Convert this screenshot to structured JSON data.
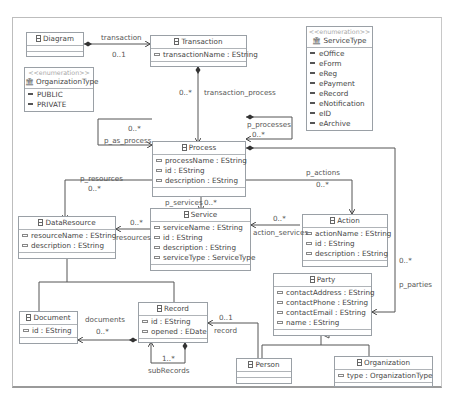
{
  "diagram": {
    "classes": {
      "diagram": {
        "name": "Diagram",
        "attributes": []
      },
      "transaction": {
        "name": "Transaction",
        "attributes": [
          "transactionName : EString"
        ]
      },
      "process": {
        "name": "Process",
        "attributes": [
          "processName : EString",
          "id : EString",
          "description : EString"
        ]
      },
      "data_resource": {
        "name": "DataResource",
        "attributes": [
          "resourceName : EString",
          "description : EString"
        ]
      },
      "service": {
        "name": "Service",
        "attributes": [
          "serviceName : EString",
          "id : EString",
          "description : EString",
          "serviceType : ServiceType"
        ]
      },
      "action": {
        "name": "Action",
        "attributes": [
          "actionName : EString",
          "id : EString",
          "description : EString"
        ]
      },
      "party": {
        "name": "Party",
        "attributes": [
          "contactAddress : EString",
          "contactPhone : EString",
          "contactEmail : EString",
          "name : EString"
        ]
      },
      "document": {
        "name": "Document",
        "attributes": [
          "id : EString"
        ]
      },
      "record": {
        "name": "Record",
        "attributes": [
          "id : EString",
          "opened : EDate"
        ]
      },
      "person": {
        "name": "Person",
        "attributes": []
      },
      "organization": {
        "name": "Organization",
        "attributes": [
          "type : OrganizationType"
        ]
      }
    },
    "enums": {
      "organization_type": {
        "stereotype": "<<enumeration>>",
        "name": "OrganizationType",
        "literals": [
          "PUBLIC",
          "PRIVATE"
        ]
      },
      "service_type": {
        "stereotype": "<<enumeration>>",
        "name": "ServiceType",
        "literals": [
          "eOffice",
          "eForm",
          "eReg",
          "ePayment",
          "eRecord",
          "eNotification",
          "eID",
          "eArchive"
        ]
      }
    },
    "references": {
      "transaction": {
        "name": "transaction",
        "multiplicity": "0..1"
      },
      "transaction_process": {
        "name": "transaction_process",
        "multiplicity": "0..*"
      },
      "p_as_process": {
        "name": "p_as_process",
        "multiplicity": "0..*"
      },
      "p_processes": {
        "name": "p_processes",
        "multiplicity": "0..*"
      },
      "p_resources": {
        "name": "p_resources",
        "multiplicity": "0..*"
      },
      "p_services": {
        "name": "p_services",
        "multiplicity": "0..*"
      },
      "p_actions": {
        "name": "p_actions",
        "multiplicity": "0..*"
      },
      "p_parties": {
        "name": "p_parties",
        "multiplicity": "0..*"
      },
      "resources": {
        "name": "resources",
        "multiplicity": "0..*"
      },
      "action_services": {
        "name": "action_services",
        "multiplicity": "0..*"
      },
      "documents": {
        "name": "documents",
        "multiplicity": "0..*"
      },
      "record": {
        "name": "record",
        "multiplicity": "0..1"
      },
      "sub_records": {
        "name": "subRecords",
        "multiplicity": "1..*"
      }
    }
  }
}
